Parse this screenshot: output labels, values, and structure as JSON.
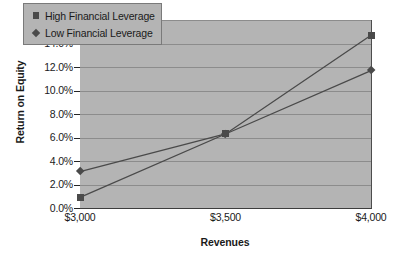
{
  "chart_data": {
    "type": "line",
    "title": "",
    "xlabel": "Revenues",
    "ylabel": "Return on Equity",
    "categories": [
      "$3,000",
      "$3,500",
      "$4,000"
    ],
    "x": [
      3000,
      3500,
      4000
    ],
    "xlim": [
      3000,
      4000
    ],
    "ylim": [
      0,
      16
    ],
    "y_tick_labels": [
      "0.0%",
      "2.0%",
      "4.0%",
      "6.0%",
      "8.0%",
      "10.0%",
      "12.0%",
      "14.0%",
      "16.0%"
    ],
    "y_tick_values": [
      0,
      2,
      4,
      6,
      8,
      10,
      12,
      14,
      16
    ],
    "grid": "horizontal",
    "legend_position": "top-left-inside",
    "plot_background": "#b4b4b4",
    "series_color": "#4a4a4a",
    "series": [
      {
        "name": "High Financial Leverage",
        "marker": "square",
        "values": [
          0.9,
          6.3,
          14.7
        ]
      },
      {
        "name": "Low Financial Leverage",
        "marker": "diamond",
        "values": [
          3.1,
          6.3,
          11.7
        ]
      }
    ]
  },
  "legend": {
    "items": [
      {
        "label": "High Financial Leverage",
        "marker": "square"
      },
      {
        "label": "Low Financial Leverage",
        "marker": "diamond"
      }
    ]
  },
  "axes": {
    "y_title": "Return on Equity",
    "x_title": "Revenues",
    "y_labels": [
      "16.0%",
      "14.0%",
      "12.0%",
      "10.0%",
      "8.0%",
      "6.0%",
      "4.0%",
      "2.0%",
      "0.0%"
    ],
    "x_labels": [
      "$3,000",
      "$3,500",
      "$4,000"
    ]
  }
}
